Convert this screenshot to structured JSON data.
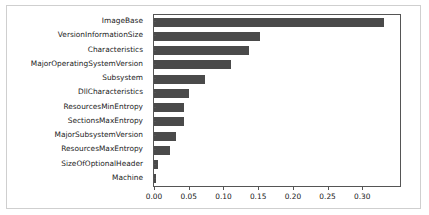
{
  "chart_data": {
    "type": "bar",
    "orientation": "horizontal",
    "title": "",
    "xlabel": "",
    "ylabel": "",
    "grid": false,
    "legend": null,
    "xlim": [
      0.0,
      0.3543
    ],
    "xticks": [
      0.0,
      0.05,
      0.1,
      0.15,
      0.2,
      0.25,
      0.3
    ],
    "xticklabels": [
      "0.00",
      "0.05",
      "0.10",
      "0.15",
      "0.20",
      "0.25",
      "0.30"
    ],
    "bar_color": "#4a4a4a",
    "categories": [
      "ImageBase",
      "VersionInformationSize",
      "Characteristics",
      "MajorOperatingSystemVersion",
      "Subsystem",
      "DllCharacteristics",
      "ResourcesMinEntropy",
      "SectionsMaxEntropy",
      "MajorSubsystemVersion",
      "ResourcesMaxEntropy",
      "SizeOfOptionalHeader",
      "Machine"
    ],
    "values": [
      0.331,
      0.153,
      0.137,
      0.111,
      0.074,
      0.051,
      0.043,
      0.043,
      0.031,
      0.023,
      0.006,
      0.003
    ]
  }
}
